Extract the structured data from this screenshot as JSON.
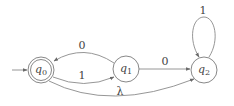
{
  "diagram": {
    "type": "finite-automaton",
    "states": [
      {
        "id": "q0",
        "name": "q",
        "sub": "0",
        "accepting": true,
        "initial": true
      },
      {
        "id": "q1",
        "name": "q",
        "sub": "1",
        "accepting": false,
        "initial": false
      },
      {
        "id": "q2",
        "name": "q",
        "sub": "2",
        "accepting": false,
        "initial": false
      }
    ],
    "transitions": [
      {
        "from": "q1",
        "to": "q0",
        "label": "0"
      },
      {
        "from": "q0",
        "to": "q1",
        "label": "1"
      },
      {
        "from": "q1",
        "to": "q2",
        "label": "0"
      },
      {
        "from": "q2",
        "to": "q2",
        "label": "1"
      },
      {
        "from": "q0",
        "to": "q2",
        "label": "λ"
      }
    ]
  },
  "colors": {
    "stroke": "#7a7a7a",
    "text": "#444444",
    "background": "#ffffff"
  }
}
